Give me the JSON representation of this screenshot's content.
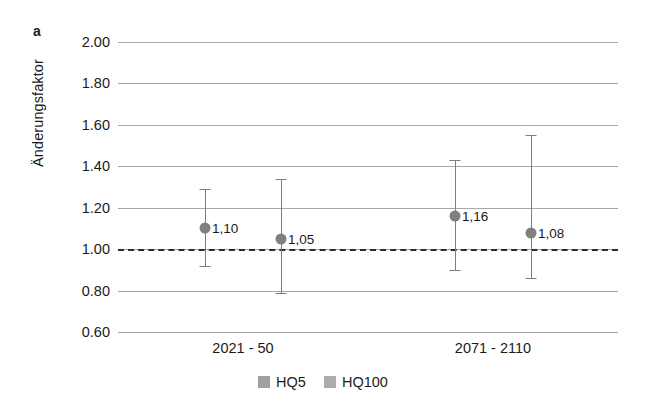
{
  "figure": {
    "panel_label": "a",
    "background_color": "#ffffff"
  },
  "chart_data": {
    "type": "scatter",
    "title": "",
    "subtitle": "",
    "xlabel": "",
    "ylabel": "Änderungsfaktor",
    "categories": [
      "2021 - 50",
      "2071 - 2110"
    ],
    "ylim": [
      0.6,
      2.0
    ],
    "ytick_values": [
      2.0,
      1.8,
      1.6,
      1.4,
      1.2,
      1.0,
      0.8,
      0.6
    ],
    "ytick_labels": [
      "2.00",
      "1.80",
      "1.60",
      "1.40",
      "1.20",
      "1.00",
      "0.80",
      "0.60"
    ],
    "grid": true,
    "reference_line": {
      "value": 1.0,
      "style": "dashed",
      "color": "#2b2b2b"
    },
    "legend_position": "bottom",
    "marker_color": "#808080",
    "errorbar_color": "#7e7e7e",
    "series": [
      {
        "name": "HQ5",
        "color": "#a0a0a0",
        "points": [
          {
            "category": "2021 - 50",
            "value": 1.1,
            "label": "1,10",
            "lower": 0.92,
            "upper": 1.29
          },
          {
            "category": "2071 - 2110",
            "value": 1.16,
            "label": "1,16",
            "lower": 0.9,
            "upper": 1.43
          }
        ]
      },
      {
        "name": "HQ100",
        "color": "#acacac",
        "points": [
          {
            "category": "2021 - 50",
            "value": 1.05,
            "label": "1,05",
            "lower": 0.79,
            "upper": 1.34
          },
          {
            "category": "2071 - 2110",
            "value": 1.08,
            "label": "1,08",
            "lower": 0.86,
            "upper": 1.55
          }
        ]
      }
    ],
    "legend": [
      {
        "label": "HQ5",
        "color": "#a0a0a0"
      },
      {
        "label": "HQ100",
        "color": "#acacac"
      }
    ]
  }
}
